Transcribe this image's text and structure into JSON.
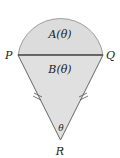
{
  "diagram": {
    "type": "geometry",
    "points": {
      "P": {
        "label": "P"
      },
      "Q": {
        "label": "Q"
      },
      "R": {
        "label": "R"
      }
    },
    "regions": {
      "A": {
        "label": "A(θ)"
      },
      "B": {
        "label": "B(θ)"
      }
    },
    "angle_label": "θ",
    "equal_side_marks": "double tick",
    "colors": {
      "fill": "#dcdcdc",
      "stroke": "#666666",
      "chord": "#555555"
    }
  }
}
